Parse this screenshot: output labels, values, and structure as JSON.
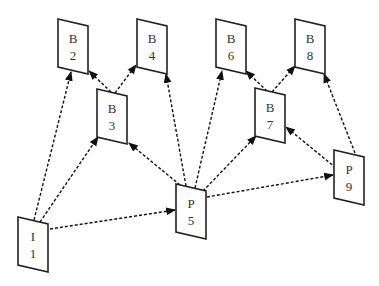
{
  "diagram": {
    "title": "",
    "nodes": [
      {
        "id": "I1",
        "type": "I",
        "line1": "I",
        "line2": "1",
        "x": 18,
        "y": 217
      },
      {
        "id": "B2",
        "type": "B",
        "line1": "B",
        "line2": "2",
        "x": 58,
        "y": 19
      },
      {
        "id": "B3",
        "type": "B",
        "line1": "B",
        "line2": "3",
        "x": 97,
        "y": 89
      },
      {
        "id": "B4",
        "type": "B",
        "line1": "B",
        "line2": "4",
        "x": 137,
        "y": 19
      },
      {
        "id": "P5",
        "type": "P",
        "line1": "P",
        "line2": "5",
        "x": 176,
        "y": 184
      },
      {
        "id": "B6",
        "type": "B",
        "line1": "B",
        "line2": "6",
        "x": 216,
        "y": 19
      },
      {
        "id": "B7",
        "type": "B",
        "line1": "B",
        "line2": "7",
        "x": 255,
        "y": 88
      },
      {
        "id": "B8",
        "type": "B",
        "line1": "B",
        "line2": "8",
        "x": 295,
        "y": 19
      },
      {
        "id": "P9",
        "type": "P",
        "line1": "P",
        "line2": "9",
        "x": 334,
        "y": 150
      }
    ],
    "edges": [
      {
        "from": "I1",
        "to": "B2",
        "x1": 34,
        "y1": 220,
        "x2": 71,
        "y2": 72
      },
      {
        "from": "I1",
        "to": "B3",
        "x1": 40,
        "y1": 222,
        "x2": 98,
        "y2": 137
      },
      {
        "from": "I1",
        "to": "P5",
        "x1": 50,
        "y1": 229,
        "x2": 175,
        "y2": 210
      },
      {
        "from": "B3",
        "to": "B2",
        "x1": 111,
        "y1": 92,
        "x2": 89,
        "y2": 71
      },
      {
        "from": "B3",
        "to": "B4",
        "x1": 115,
        "y1": 93,
        "x2": 136,
        "y2": 65
      },
      {
        "from": "P5",
        "to": "B3",
        "x1": 180,
        "y1": 185,
        "x2": 129,
        "y2": 143
      },
      {
        "from": "P5",
        "to": "B4",
        "x1": 186,
        "y1": 186,
        "x2": 166,
        "y2": 74
      },
      {
        "from": "P5",
        "to": "B6",
        "x1": 195,
        "y1": 188,
        "x2": 222,
        "y2": 71
      },
      {
        "from": "P5",
        "to": "B7",
        "x1": 203,
        "y1": 191,
        "x2": 256,
        "y2": 136
      },
      {
        "from": "P5",
        "to": "P9",
        "x1": 207,
        "y1": 197,
        "x2": 333,
        "y2": 175
      },
      {
        "from": "B7",
        "to": "B6",
        "x1": 267,
        "y1": 91,
        "x2": 246,
        "y2": 71
      },
      {
        "from": "B7",
        "to": "B8",
        "x1": 272,
        "y1": 92,
        "x2": 295,
        "y2": 66
      },
      {
        "from": "P9",
        "to": "B7",
        "x1": 336,
        "y1": 168,
        "x2": 286,
        "y2": 127
      },
      {
        "from": "P9",
        "to": "B8",
        "x1": 355,
        "y1": 153,
        "x2": 324,
        "y2": 74
      }
    ]
  }
}
